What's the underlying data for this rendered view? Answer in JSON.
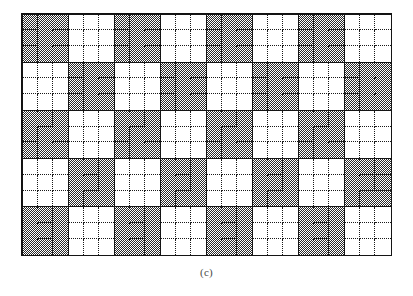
{
  "figure": {
    "caption": "(c)",
    "type": "checkerboard-pattern-diagram",
    "geometry": {
      "block_columns": 8,
      "block_rows": 5,
      "cells_per_block_x": 3,
      "cells_per_block_y": 3,
      "total_cell_columns": 24,
      "total_cell_rows": 15,
      "grid_left_px": 21,
      "grid_top_px": 13,
      "grid_width_px": 371,
      "grid_height_px": 243,
      "block_width_px": 46,
      "block_height_px": 48
    },
    "colors": {
      "background": "#ffffff",
      "block_border": "#141414",
      "cell_divider": "#1a1a1a",
      "shaded_fill": "#2b2b2b",
      "unshaded_fill": "#ffffff",
      "caption_text": "#4a4a4a"
    },
    "legend": {
      "shaded_label": "shaded block",
      "unshaded_label": "unshaded block"
    },
    "blocks": [
      [
        1,
        0,
        1,
        0,
        1,
        0,
        1,
        0
      ],
      [
        0,
        1,
        0,
        1,
        0,
        1,
        0,
        1
      ],
      [
        1,
        0,
        1,
        0,
        1,
        0,
        1,
        0
      ],
      [
        0,
        1,
        0,
        1,
        0,
        1,
        0,
        1
      ],
      [
        1,
        0,
        1,
        0,
        1,
        0,
        1,
        0
      ]
    ]
  }
}
